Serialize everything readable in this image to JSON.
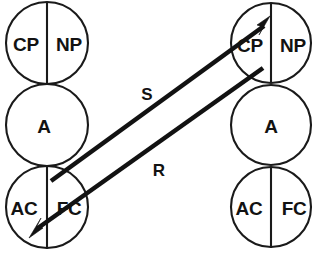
{
  "diagram": {
    "type": "transactional-analysis-crossed-transaction",
    "background_color": "#ffffff",
    "stroke_color": "#121212",
    "columns": [
      {
        "id": "left-person",
        "center_x": 47,
        "ego_states": [
          {
            "id": "left-parent",
            "name": "parent",
            "center_y": 43,
            "radius": 41,
            "divided": true,
            "left_label": "CP",
            "right_label": "NP"
          },
          {
            "id": "left-adult",
            "name": "adult",
            "center_y": 125,
            "radius": 41,
            "divided": false,
            "center_label": "A"
          },
          {
            "id": "left-child",
            "name": "child",
            "center_y": 207,
            "radius": 41,
            "divided": true,
            "left_label": "AC",
            "right_label": "FC"
          }
        ]
      },
      {
        "id": "right-person",
        "center_x": 271,
        "ego_states": [
          {
            "id": "right-parent",
            "name": "parent",
            "center_y": 43,
            "radius": 40,
            "divided": true,
            "left_label": "CP",
            "right_label": "NP"
          },
          {
            "id": "right-adult",
            "name": "adult",
            "center_y": 125,
            "radius": 40,
            "divided": false,
            "center_label": "A"
          },
          {
            "id": "right-child",
            "name": "child",
            "center_y": 207,
            "radius": 40,
            "divided": true,
            "left_label": "AC",
            "right_label": "FC"
          }
        ]
      }
    ],
    "transactions": [
      {
        "id": "stimulus",
        "label": "S",
        "label_x": 147,
        "label_y": 94,
        "from": "left-child",
        "to": "right-parent",
        "direction": "up-right",
        "start_x": 51,
        "start_y": 181,
        "end_x": 266,
        "end_y": 24
      },
      {
        "id": "response",
        "label": "R",
        "label_x": 159,
        "label_y": 170,
        "from": "right-parent",
        "to": "left-child",
        "direction": "down-left",
        "start_x": 262,
        "start_y": 69,
        "end_x": 35,
        "end_y": 231
      }
    ]
  }
}
